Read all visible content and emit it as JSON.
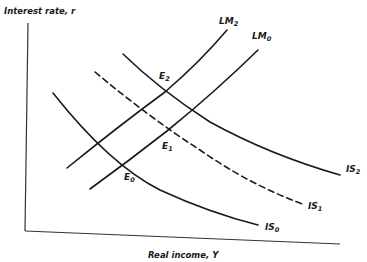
{
  "diagram": {
    "type": "IS-LM",
    "y_axis_label": "Interest rate, r",
    "x_axis_label": "Real income, Y",
    "curves": {
      "IS0": {
        "name": "IS",
        "sub": "0",
        "style": "solid"
      },
      "IS1": {
        "name": "IS",
        "sub": "1",
        "style": "dashed"
      },
      "IS2": {
        "name": "IS",
        "sub": "2",
        "style": "solid"
      },
      "LM0": {
        "name": "LM",
        "sub": "0",
        "style": "solid"
      },
      "LM2": {
        "name": "LM",
        "sub": "2",
        "style": "solid"
      }
    },
    "equilibria": {
      "E0": {
        "name": "E",
        "sub": "0",
        "intersection": "IS0 x LM0"
      },
      "E1": {
        "name": "E",
        "sub": "1",
        "intersection": "IS1 x LM0"
      },
      "E2": {
        "name": "E",
        "sub": "2",
        "intersection": "IS2 x LM2"
      }
    },
    "colors": {
      "ink": "#1a1a1a",
      "background": "#ffffff"
    }
  }
}
